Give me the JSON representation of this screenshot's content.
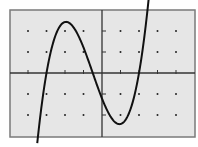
{
  "chart_data": {
    "type": "line",
    "title": "",
    "xlabel": "",
    "ylabel": "",
    "xlim": [
      -5,
      5
    ],
    "ylim": [
      -3,
      3
    ],
    "grid": "dots",
    "x_unit_px": 18.5,
    "y_unit_px": 21,
    "colors": {
      "background": "#e6e6e6",
      "frame": "#7a7a7a",
      "axis": "#333333",
      "curve": "#111111",
      "dot": "#222222"
    },
    "series": [
      {
        "name": "cubic",
        "roots": [
          -3,
          -0.5,
          2
        ],
        "local_max": [
          -1.8,
          2.4
        ],
        "local_min": [
          1,
          -2.5
        ],
        "x": [
          -3.5,
          -3,
          -2.5,
          -2,
          -1.8,
          -1.5,
          -1,
          -0.5,
          0,
          0.5,
          1,
          1.5,
          2,
          2.5,
          2.6
        ],
        "y": [
          -3.1,
          0,
          1.8,
          2.35,
          2.4,
          2.3,
          1.5,
          0,
          -1.2,
          -2.2,
          -2.5,
          -1.9,
          0,
          2.4,
          3.0
        ]
      }
    ]
  }
}
